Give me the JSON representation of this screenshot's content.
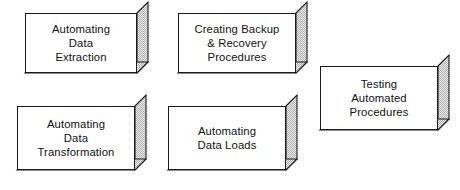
{
  "diagram": {
    "background_color": "#ffffff",
    "box_face_color": "#ffffff",
    "box_outline_color": "#1a1a1a",
    "box_shadow_color": "#b5b5b5",
    "box_shadow_base_color": "#e6e6e6",
    "text_color": "#111111",
    "boxes": [
      {
        "id": "automating-data-extraction",
        "label": "Automating\nData\nExtraction",
        "x": 25,
        "y": 13,
        "width": 112,
        "height": 60,
        "depth": 11
      },
      {
        "id": "creating-backup-recovery-procedures",
        "label": "Creating Backup\n& Recovery\nProcedures",
        "x": 178,
        "y": 13,
        "width": 118,
        "height": 60,
        "depth": 11
      },
      {
        "id": "testing-automated-procedures",
        "label": "Testing\nAutomated\nProcedures",
        "x": 320,
        "y": 66,
        "width": 118,
        "height": 64,
        "depth": 11
      },
      {
        "id": "automating-data-transformation",
        "label": "Automating\nData\nTransformation",
        "x": 17,
        "y": 106,
        "width": 118,
        "height": 64,
        "depth": 11
      },
      {
        "id": "automating-data-loads",
        "label": "Automating\nData Loads",
        "x": 168,
        "y": 106,
        "width": 118,
        "height": 64,
        "depth": 11
      }
    ]
  }
}
